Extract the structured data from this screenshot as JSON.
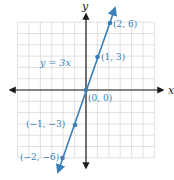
{
  "chart_data": {
    "type": "line",
    "title": "",
    "xlabel": "x",
    "ylabel": "y",
    "xlim": [
      -6,
      6
    ],
    "ylim": [
      -6,
      6
    ],
    "grid": true,
    "legend": "none",
    "series": [
      {
        "name": "y = 3x",
        "equation": "y = 3x",
        "points": [
          {
            "x": -2,
            "y": -6,
            "label": "(−2, −6)"
          },
          {
            "x": -1,
            "y": -3,
            "label": "(−1, −3)"
          },
          {
            "x": 0,
            "y": 0,
            "label": "(0, 0)"
          },
          {
            "x": 1,
            "y": 3,
            "label": "(1, 3)"
          },
          {
            "x": 2,
            "y": 6,
            "label": "(2, 6)"
          }
        ]
      }
    ],
    "annotations": [
      "y = 3x",
      "(2, 6)",
      "(1, 3)",
      "(0, 0)",
      "(−1, −3)",
      "(−2, −6)"
    ]
  },
  "axes": {
    "x_label": "x",
    "y_label": "y"
  },
  "equation_label": "y = 3x",
  "point_labels": [
    "(2, 6)",
    "(1, 3)",
    "(0, 0)",
    "(−1, −3)",
    "(−2, −6)"
  ],
  "colors": {
    "line": "#3a7fb8",
    "axis": "#1a1a1a",
    "grid": "#d9d9d9"
  }
}
